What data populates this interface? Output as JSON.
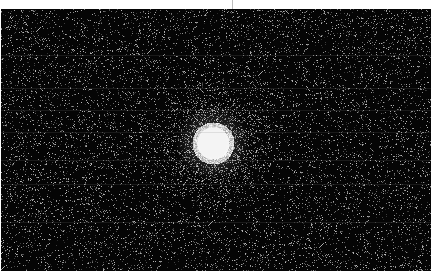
{
  "image": {
    "description": "Grayscale astronomical CCD frame showing a single bright saturated star against a noisy dark background",
    "width": 432,
    "height": 273,
    "background_color": "#050505",
    "margin_color": "#ffffff",
    "star": {
      "center_x": 213,
      "center_y": 143,
      "core_radius": 16,
      "halo_radius": 38,
      "color": "#f4f4f4"
    },
    "noise_density": 0.09,
    "scanlines_y": [
      55,
      88,
      110,
      132,
      160,
      184,
      222
    ]
  }
}
